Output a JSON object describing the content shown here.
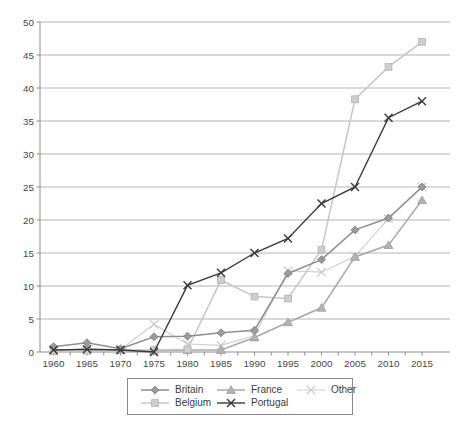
{
  "window": {
    "width": 458,
    "height": 423,
    "background": "#ffffff"
  },
  "chart_data": {
    "type": "line",
    "title": "",
    "xlabel": "",
    "ylabel": "",
    "x": [
      1960,
      1965,
      1970,
      1975,
      1980,
      1985,
      1990,
      1995,
      2000,
      2005,
      2010,
      2015
    ],
    "x_tick_labels": [
      "1960",
      "1965",
      "1970",
      "1975",
      "1980",
      "1985",
      "1990",
      "1995",
      "2000",
      "2005",
      "2010",
      "2015"
    ],
    "ylim": [
      0,
      50
    ],
    "y_ticks": [
      0,
      5,
      10,
      15,
      20,
      25,
      30,
      35,
      40,
      45,
      50
    ],
    "grid": true,
    "grid_color": "#b3b3b3",
    "axis_color": "#8c8c8c",
    "tick_label_color": "#474747",
    "legend_position": "bottom-center",
    "legend_order": [
      "Britain",
      "France",
      "Other",
      "Belgium",
      "Portugal"
    ],
    "series": [
      {
        "name": "Britain",
        "marker": "diamond",
        "line_color": "#8e8e8e",
        "marker_fill": "#9b9b9b",
        "marker_stroke": "#7d7d7d",
        "line_width": 1.5,
        "values": [
          0.8,
          1.4,
          0.5,
          2.3,
          2.4,
          2.9,
          3.3,
          11.9,
          14,
          18.5,
          20.3,
          25
        ]
      },
      {
        "name": "France",
        "marker": "triangle",
        "line_color": "#a9a9a9",
        "marker_fill": "#b3b3b3",
        "marker_stroke": "#9a9a9a",
        "line_width": 1.5,
        "values": [
          0.2,
          0.5,
          0.3,
          0.2,
          0.3,
          0.3,
          2.2,
          4.5,
          6.7,
          14.4,
          16.2,
          23
        ]
      },
      {
        "name": "Other",
        "marker": "x-thin",
        "line_color": "#cfcfcf",
        "marker_fill": "#c6c6c6",
        "marker_stroke": "#c6c6c6",
        "line_width": 1.1,
        "values": [
          0.1,
          0.3,
          0.4,
          4.2,
          1.2,
          1,
          2.5,
          12.3,
          12.1,
          14.5,
          20.2,
          25
        ]
      },
      {
        "name": "Belgium",
        "marker": "square",
        "line_color": "#c7c7c7",
        "marker_fill": "#cecece",
        "marker_stroke": "#b4b4b4",
        "line_width": 1.5,
        "values": [
          0.2,
          0.2,
          0.3,
          0.3,
          0.4,
          10.9,
          8.4,
          8.1,
          15.5,
          38.3,
          43.2,
          47
        ]
      },
      {
        "name": "Portugal",
        "marker": "x-cross",
        "line_color": "#3a3a3a",
        "marker_fill": "#3a3a3a",
        "marker_stroke": "#3a3a3a",
        "line_width": 1.4,
        "values": [
          0.3,
          0.4,
          0.3,
          0,
          10.1,
          12,
          15,
          17.2,
          22.5,
          25,
          35.5,
          38
        ]
      }
    ]
  }
}
